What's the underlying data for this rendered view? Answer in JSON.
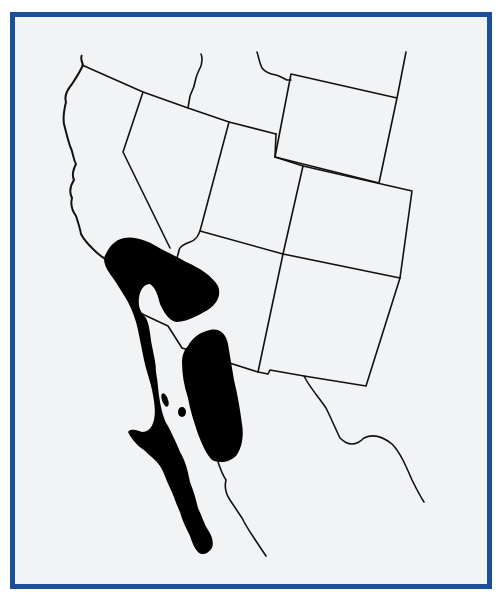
{
  "map": {
    "type": "species range map",
    "region": "Southwestern United States and northwestern Mexico",
    "colors": {
      "frame_border": "#1b4f98",
      "background": "#f2f3f5",
      "lines": "#111111",
      "range_fill": "#000000"
    },
    "features": [
      {
        "name": "state-borders",
        "description": "Outline boundaries of western US states"
      },
      {
        "name": "pacific-coastline",
        "description": "Coastline of California and Baja California"
      },
      {
        "name": "mexico-border-and-sonora-coast",
        "description": "Mainland Mexico coast and US-Mexico border"
      },
      {
        "name": "range-area-california-baja",
        "description": "Black range area covering southern California and Baja California peninsula"
      },
      {
        "name": "range-area-mojave",
        "description": "Black range lobe over Mojave/southern Nevada-Arizona"
      },
      {
        "name": "range-area-sonora",
        "description": "Black range area over Sonoran Desert, Arizona and Sonora"
      }
    ]
  }
}
